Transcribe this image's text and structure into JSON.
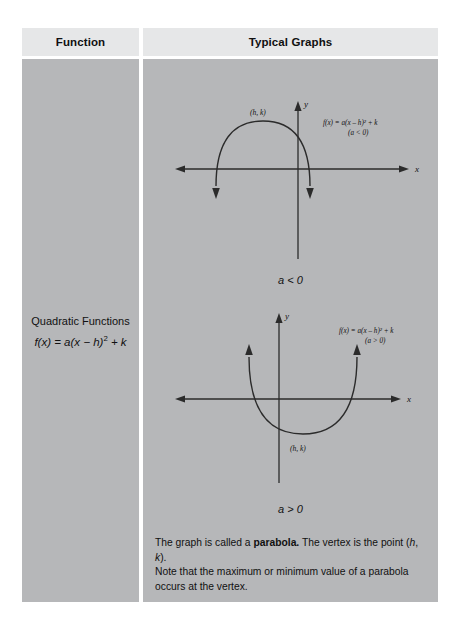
{
  "table": {
    "headers": {
      "function": "Function",
      "typical_graphs": "Typical Graphs"
    },
    "function_cell": {
      "title": "Quadratic Functions",
      "formula_prefix": "f(x) = a(x − h)",
      "formula_exponent": "2",
      "formula_suffix": " + k"
    },
    "graphs": [
      {
        "id": "parabola-opens-down",
        "vertex_label": "(h, k)",
        "equation_line1": "f(x) = a(x − h)² + k",
        "equation_line2": "(a < 0)",
        "x_axis_label": "x",
        "y_axis_label": "y",
        "case_label": "a < 0"
      },
      {
        "id": "parabola-opens-up",
        "vertex_label": "(h, k)",
        "equation_line1": "f(x) = a(x − h)² + k",
        "equation_line2": "(a > 0)",
        "x_axis_label": "x",
        "y_axis_label": "y",
        "case_label": "a > 0"
      }
    ],
    "notes": {
      "note1_part1": "The graph is called a ",
      "note1_bold": "parabola.",
      "note1_part2": " The vertex is the point (",
      "note1_italic_h": "h",
      "note1_part3": ", ",
      "note1_italic_k": "k",
      "note1_part4": ").",
      "note2": "Note that the maximum or minimum value of a parabola occurs at the vertex."
    }
  },
  "colors": {
    "page_background": "#ffffff",
    "header_fill": "#e6e7e8",
    "body_fill": "#b6b7b9",
    "text": "#111111",
    "axis_stroke": "#2b2b2b",
    "curve_stroke": "#2b2b2b"
  }
}
